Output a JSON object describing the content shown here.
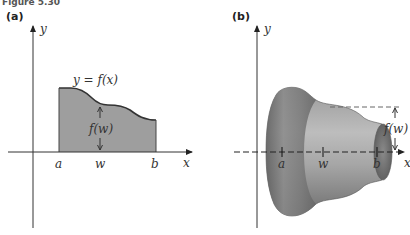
{
  "figure": {
    "title": "Figure 5.30",
    "panels": [
      {
        "label": "(a)",
        "y_axis_label": "y",
        "x_axis_label": "x",
        "curve_label": "y = f(x)",
        "height_label": "f(w)",
        "tick_labels": [
          "a",
          "w",
          "b"
        ],
        "description": "Region under curve y = f(x) between x = a and x = b, with height f(w) at x = w"
      },
      {
        "label": "(b)",
        "y_axis_label": "y",
        "x_axis_label": "x",
        "height_label": "f(w)",
        "tick_labels": [
          "a",
          "w",
          "b"
        ],
        "description": "Solid of revolution obtained by rotating the region about the x-axis; radius f(w) at x = w"
      }
    ]
  },
  "colors": {
    "region_fill": "#9e9e9e",
    "curve": "#333333",
    "axis": "#333333",
    "solid_dark": "#6a6a6a",
    "solid_light": "#b8b8b8"
  }
}
